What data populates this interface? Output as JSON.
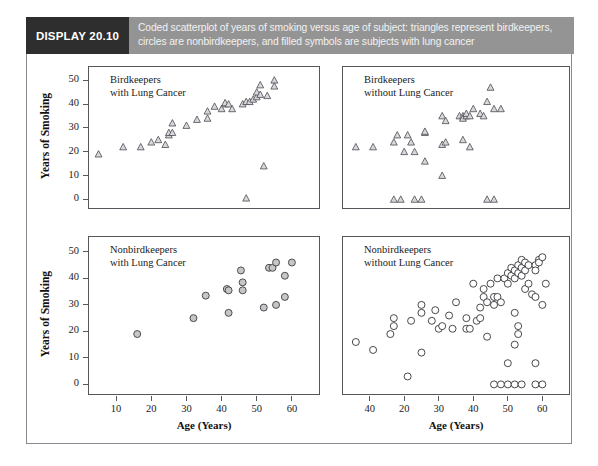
{
  "banner": {
    "tag": "DISPLAY 20.10",
    "caption": "Coded scatterplot of years of smoking versus age of subject: triangles represent birdkeepers, circles are nonbirdkeepers, and filled symbols are subjects with lung cancer",
    "tag_bg": "#2e2e2e",
    "bar_bg": "#949494",
    "caption_color": "#f2f2f2"
  },
  "axes": {
    "ylabel": "Years of Smoking",
    "xlabel": "Age (Years)",
    "yticks": [
      0,
      10,
      20,
      30,
      40,
      50
    ],
    "ylim": [
      -4,
      56
    ],
    "xlim": [
      2,
      68
    ],
    "xticks_bottom_left": [
      10,
      20,
      30,
      40,
      50,
      60
    ],
    "xticks_bottom_right": [
      40,
      20,
      30,
      40,
      50,
      60
    ]
  },
  "chart_data": {
    "type": "scatter",
    "title": "Coded scatterplot of years of smoking versus age of subject",
    "xlabel": "Age (Years)",
    "ylabel": "Years of Smoking",
    "xlim": [
      2,
      68
    ],
    "ylim": [
      -4,
      56
    ],
    "grid": false,
    "legend": "none",
    "panels": [
      {
        "id": "birdkeepers-with-lung-cancer",
        "title": "Birdkeepers\nwith Lung Cancer",
        "marker": "triangle",
        "filled": false,
        "position": "top-left",
        "n": 33,
        "points": [
          [
            5,
            19
          ],
          [
            12,
            22
          ],
          [
            17,
            22
          ],
          [
            20,
            24
          ],
          [
            22,
            25
          ],
          [
            24,
            23
          ],
          [
            25,
            27
          ],
          [
            25,
            28
          ],
          [
            26,
            28
          ],
          [
            26,
            32
          ],
          [
            30,
            31
          ],
          [
            33,
            33.5
          ],
          [
            36,
            34
          ],
          [
            36,
            37
          ],
          [
            38,
            39
          ],
          [
            40,
            38
          ],
          [
            41,
            40
          ],
          [
            41,
            40.5
          ],
          [
            42,
            40
          ],
          [
            43,
            38
          ],
          [
            46,
            40
          ],
          [
            47,
            41
          ],
          [
            48,
            41
          ],
          [
            49,
            42
          ],
          [
            50,
            43
          ],
          [
            50,
            45
          ],
          [
            51,
            44
          ],
          [
            51,
            48
          ],
          [
            53,
            43.5
          ],
          [
            55,
            50
          ],
          [
            55,
            47.5
          ],
          [
            52,
            14
          ],
          [
            47,
            0.5
          ]
        ]
      },
      {
        "id": "birdkeepers-without-lung-cancer",
        "title": "Birdkeepers\nwithout Lung Cancer",
        "marker": "triangle",
        "filled": false,
        "position": "top-right",
        "n": 35,
        "points": [
          [
            6,
            22
          ],
          [
            11,
            22
          ],
          [
            17,
            24
          ],
          [
            18,
            27
          ],
          [
            21,
            27
          ],
          [
            20,
            20
          ],
          [
            23,
            20
          ],
          [
            22,
            24
          ],
          [
            26,
            28
          ],
          [
            26,
            28.5
          ],
          [
            31,
            35
          ],
          [
            32,
            33
          ],
          [
            36,
            35
          ],
          [
            37,
            35
          ],
          [
            37,
            34
          ],
          [
            38,
            35
          ],
          [
            38,
            36
          ],
          [
            39,
            35
          ],
          [
            40,
            38
          ],
          [
            42,
            36
          ],
          [
            44,
            41
          ],
          [
            43,
            35
          ],
          [
            46,
            38
          ],
          [
            45,
            47
          ],
          [
            48,
            38
          ],
          [
            31,
            23
          ],
          [
            32,
            24
          ],
          [
            37,
            25
          ],
          [
            39,
            22
          ],
          [
            26,
            16
          ],
          [
            31,
            10
          ],
          [
            17,
            0
          ],
          [
            19,
            0
          ],
          [
            23,
            0
          ],
          [
            25,
            0
          ],
          [
            44,
            0
          ],
          [
            46,
            0
          ]
        ]
      },
      {
        "id": "nonbirdkeepers-with-lung-cancer",
        "title": "Nonbirdkeepers\nwith Lung Cancer",
        "marker": "circle",
        "filled": true,
        "position": "bottom-left",
        "n": 16,
        "points": [
          [
            16,
            19
          ],
          [
            32,
            25
          ],
          [
            35.5,
            33.5
          ],
          [
            41.5,
            36
          ],
          [
            42,
            35.5
          ],
          [
            42,
            27
          ],
          [
            45.5,
            43
          ],
          [
            46,
            38.5
          ],
          [
            46,
            35.5
          ],
          [
            52,
            29
          ],
          [
            53.5,
            44
          ],
          [
            54.5,
            44
          ],
          [
            55.5,
            46
          ],
          [
            55.5,
            30
          ],
          [
            58,
            41
          ],
          [
            58,
            33
          ],
          [
            60,
            46
          ]
        ]
      },
      {
        "id": "nonbirdkeepers-without-lung-cancer",
        "title": "Nonbirdkeepers\nwithout Lung Cancer",
        "marker": "circle",
        "filled": false,
        "position": "bottom-right",
        "n": 64,
        "points": [
          [
            6,
            16
          ],
          [
            11,
            13
          ],
          [
            16,
            19
          ],
          [
            17,
            25
          ],
          [
            17,
            22
          ],
          [
            22,
            24
          ],
          [
            25,
            27
          ],
          [
            25,
            30
          ],
          [
            28,
            24
          ],
          [
            29,
            28
          ],
          [
            30,
            21
          ],
          [
            31,
            22
          ],
          [
            33,
            26
          ],
          [
            34,
            21
          ],
          [
            35,
            31
          ],
          [
            38,
            25
          ],
          [
            38,
            21
          ],
          [
            39,
            21
          ],
          [
            40,
            38
          ],
          [
            41,
            24
          ],
          [
            42,
            29
          ],
          [
            42,
            25
          ],
          [
            43,
            36
          ],
          [
            43,
            33
          ],
          [
            44,
            31
          ],
          [
            44,
            18
          ],
          [
            45,
            38
          ],
          [
            46,
            33
          ],
          [
            46,
            30
          ],
          [
            47,
            40
          ],
          [
            47,
            33
          ],
          [
            48,
            31
          ],
          [
            49,
            40
          ],
          [
            50,
            42
          ],
          [
            50,
            38
          ],
          [
            51,
            44
          ],
          [
            51,
            41
          ],
          [
            52,
            43
          ],
          [
            52,
            40
          ],
          [
            53,
            45
          ],
          [
            53,
            42
          ],
          [
            54,
            47
          ],
          [
            54,
            44
          ],
          [
            54,
            41
          ],
          [
            55,
            46
          ],
          [
            55,
            43
          ],
          [
            55,
            36
          ],
          [
            56,
            45
          ],
          [
            56,
            38
          ],
          [
            57,
            34
          ],
          [
            58,
            45
          ],
          [
            58,
            43
          ],
          [
            58,
            33
          ],
          [
            59,
            47
          ],
          [
            59,
            46
          ],
          [
            60,
            48
          ],
          [
            60,
            30
          ],
          [
            61,
            38
          ],
          [
            52,
            27
          ],
          [
            53,
            22
          ],
          [
            53,
            19
          ],
          [
            52,
            15
          ],
          [
            50,
            8
          ],
          [
            58,
            8
          ],
          [
            25,
            12
          ],
          [
            21,
            3
          ],
          [
            46,
            0
          ],
          [
            48,
            0
          ],
          [
            50,
            0
          ],
          [
            52,
            0
          ],
          [
            54,
            0
          ],
          [
            58,
            0
          ],
          [
            60,
            0
          ]
        ]
      }
    ]
  }
}
